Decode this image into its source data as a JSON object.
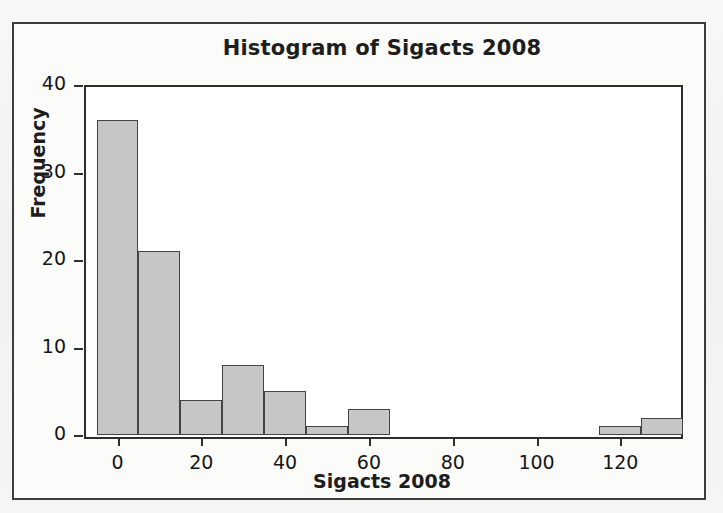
{
  "chart_data": {
    "type": "bar",
    "title": "Histogram of Sigacts 2008",
    "xlabel": "Sigacts 2008",
    "ylabel": "Frequency",
    "grid": false,
    "legend": null,
    "xlim": [
      -8,
      134
    ],
    "ylim": [
      0,
      40
    ],
    "bin_width": 10,
    "x_ticks": [
      0,
      20,
      40,
      60,
      80,
      100,
      120
    ],
    "x_tick_labels": [
      "0",
      "20",
      "40",
      "60",
      "80",
      "100",
      "120"
    ],
    "y_ticks": [
      0,
      10,
      20,
      30,
      40
    ],
    "y_tick_labels": [
      "0",
      "10",
      "20",
      "30",
      "40"
    ],
    "categories": [
      "-5 to 5",
      "5 to 15",
      "15 to 25",
      "25 to 35",
      "35 to 45",
      "45 to 55",
      "55 to 65",
      "65 to 75",
      "75 to 85",
      "85 to 95",
      "95 to 105",
      "105 to 115",
      "115 to 125",
      "125 to 135"
    ],
    "bin_starts": [
      -5,
      5,
      15,
      25,
      35,
      45,
      55,
      65,
      75,
      85,
      95,
      105,
      115,
      125
    ],
    "bin_ends": [
      5,
      15,
      25,
      35,
      45,
      55,
      65,
      75,
      85,
      95,
      105,
      115,
      125,
      135
    ],
    "values": [
      36,
      21,
      4,
      8,
      5,
      1,
      3,
      0,
      0,
      0,
      0,
      0,
      1,
      2
    ],
    "bar_fill_color": "#c6c6c6",
    "bar_edge_color": "#434343",
    "axis_color": "#2e2e2e",
    "plot_background": "#ffffff",
    "figure_background": "#f4f4f4"
  }
}
